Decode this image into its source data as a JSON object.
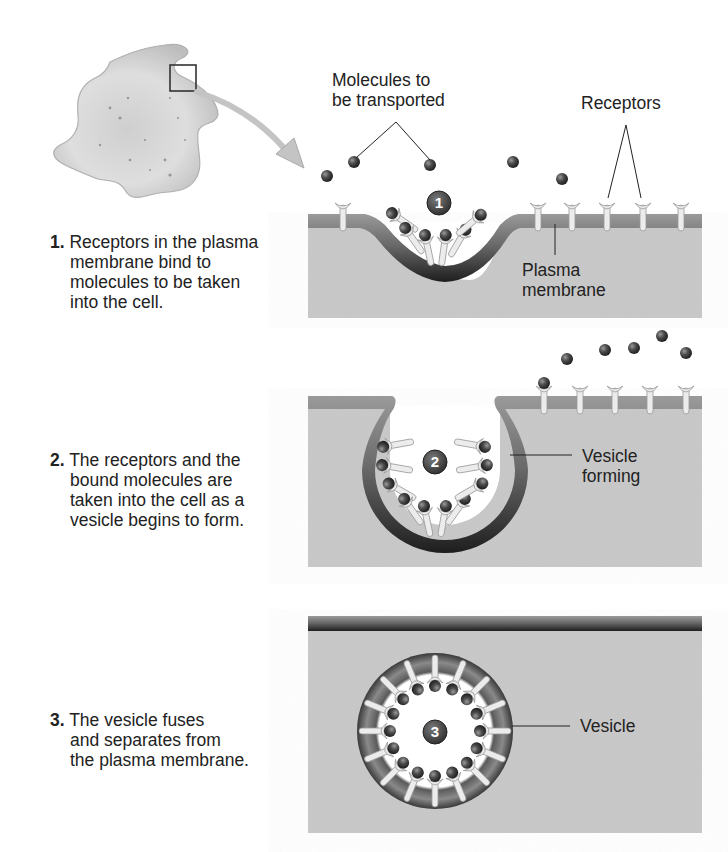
{
  "figure": {
    "colors": {
      "cytoplasm": "#c9c9c9",
      "membrane_dark": "#3a3a3a",
      "membrane_mid": "#7a7a7a",
      "molecule": "#4a4a4a",
      "receptor": "#ececec",
      "step_badge": "#4d4d4d"
    }
  },
  "overview": {
    "cell_icon": "amoeba-cell-icon",
    "zoom_box_icon": "zoom-region-icon",
    "arrow_icon": "curved-arrow-icon"
  },
  "steps": [
    {
      "number": "1.",
      "badge": "1",
      "text": "Receptors in the plasma membrane bind to molecules to be taken into the cell.",
      "lines": [
        "Receptors in the plasma",
        "membrane bind to",
        "molecules to be taken",
        "into the cell."
      ]
    },
    {
      "number": "2.",
      "badge": "2",
      "text": "The receptors and the bound molecules are taken into the cell as a vesicle begins to form.",
      "lines": [
        "The receptors and the",
        "bound molecules are",
        "taken into the cell as a",
        "vesicle begins to form."
      ]
    },
    {
      "number": "3.",
      "badge": "3",
      "text": "The vesicle fuses and separates from the plasma membrane.",
      "lines": [
        "The vesicle fuses",
        "and separates from",
        "the plasma membrane."
      ]
    }
  ],
  "labels": {
    "molecules": [
      "Molecules to",
      "be transported"
    ],
    "receptors": "Receptors",
    "plasma_membrane": [
      "Plasma",
      "membrane"
    ],
    "vesicle_forming": [
      "Vesicle",
      "forming"
    ],
    "vesicle": "Vesicle"
  }
}
